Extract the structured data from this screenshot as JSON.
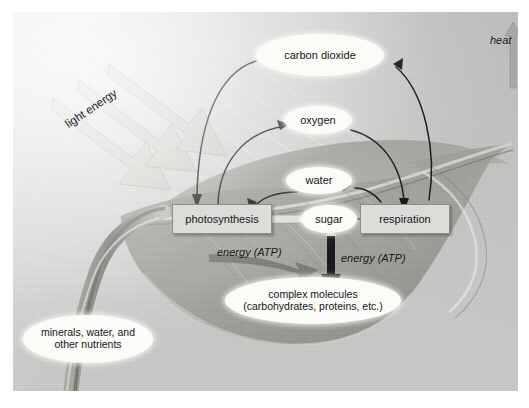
{
  "diagram": {
    "nodes": {
      "carbon_dioxide": "carbon dioxide",
      "oxygen": "oxygen",
      "water": "water",
      "sugar": "sugar",
      "photosynthesis": "photosynthesis",
      "respiration": "respiration",
      "complex_molecules_line1": "complex molecules",
      "complex_molecules_line2": "(carbohydrates, proteins, etc.)",
      "minerals_line1": "minerals, water, and",
      "minerals_line2": "other nutrients"
    },
    "labels": {
      "light_energy": "light energy",
      "heat": "heat",
      "energy_atp_left": "energy (ATP)",
      "energy_atp_right": "energy (ATP)"
    },
    "edges": [
      {
        "from": "carbon dioxide",
        "to": "photosynthesis",
        "style": "curved-arrow"
      },
      {
        "from": "photosynthesis",
        "to": "oxygen",
        "style": "curved-arrow"
      },
      {
        "from": "water",
        "to": "photosynthesis",
        "style": "curved-arrow"
      },
      {
        "from": "photosynthesis",
        "to": "sugar",
        "style": "thick-grey-arrow"
      },
      {
        "from": "sugar",
        "to": "respiration",
        "style": "straight-arrow"
      },
      {
        "from": "oxygen",
        "to": "respiration",
        "style": "curved-arrow"
      },
      {
        "from": "respiration",
        "to": "carbon dioxide",
        "style": "curved-arrow"
      },
      {
        "from": "respiration",
        "to": "water",
        "style": "curved-arrow"
      },
      {
        "from": "sugar",
        "to": "complex molecules",
        "style": "double-headed-arrow"
      },
      {
        "from": "sun",
        "to": "leaf",
        "style": "light-ray-arrows"
      },
      {
        "from": "respiration",
        "to": "heat",
        "style": "grey-up-arrow"
      }
    ],
    "colors": {
      "background": "#c9cac8",
      "node_fill": "#fbfbf7",
      "box_fill": "#dcdcd8",
      "box_border": "#8d8e8a",
      "arrow": "#15161a",
      "leaf_dark": "#8e9089",
      "leaf_mid": "#a9aba3",
      "ray": "#d7d8d2",
      "text": "#15161a"
    }
  }
}
